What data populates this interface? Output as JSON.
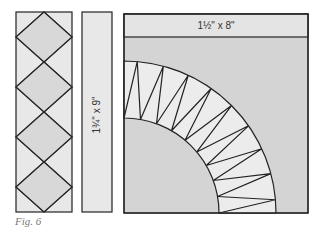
{
  "figure": {
    "caption": "Fig. 6",
    "colors": {
      "light_fill": "#e8e8e8",
      "mid_fill": "#d4d4d4",
      "stroke": "#222222",
      "caption": "#777777"
    },
    "left_strip": {
      "description": "strip with diagonal diamond pattern",
      "diamonds": 4
    },
    "middle_strip": {
      "label": "1¾\" x 9\""
    },
    "quilt_block": {
      "top_band_label": "1½\" x 8\"",
      "fan_spikes": 9,
      "description": "quarter-circle fan with pointed spikes"
    }
  }
}
